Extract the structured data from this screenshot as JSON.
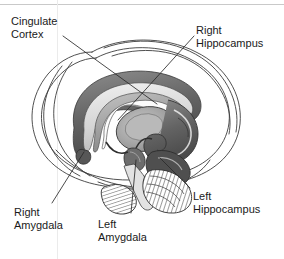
{
  "figure": {
    "background_color": "#ffffff",
    "frame_color": "#c9c9c9",
    "text_color": "#1a1a1a"
  },
  "labels": {
    "cingulate_cortex": {
      "line1": "Cingulate",
      "line2": "Cortex"
    },
    "right_hippocampus": {
      "line1": "Right",
      "line2": "Hippocampus"
    },
    "right_amygdala": {
      "line1": "Right",
      "line2": "Amygdala"
    },
    "left_amygdala": {
      "line1": "Left",
      "line2": "Amygdala"
    },
    "left_hippocampus": {
      "line1": "Left",
      "line2": "Hippocampus"
    }
  },
  "structures": [
    {
      "name": "cerebral-outline",
      "shading": "none",
      "stroke": "#3a3a3a"
    },
    {
      "name": "cingulate-gyrus-band",
      "shading": "dark-gray",
      "color": "#6e6e6e"
    },
    {
      "name": "corpus-callosum-band",
      "shading": "light-gray",
      "color": "#d5d5d5"
    },
    {
      "name": "fornix-band",
      "shading": "mid-gray",
      "color": "#9a9a9a"
    },
    {
      "name": "thalamus",
      "shading": "mid-gray",
      "color": "#a8a8a8"
    },
    {
      "name": "right-hippocampus-body",
      "shading": "dark-gray",
      "color": "#5c5c5c"
    },
    {
      "name": "left-hippocampus-body",
      "shading": "dark-gray",
      "color": "#4f4f4f"
    },
    {
      "name": "right-amygdala-nucleus",
      "shading": "dark-gray",
      "color": "#5a5a5a"
    },
    {
      "name": "left-amygdala-nucleus",
      "shading": "dark-gray",
      "color": "#6a6a6a"
    },
    {
      "name": "cerebellum",
      "shading": "hatched",
      "color": "#808080"
    },
    {
      "name": "brainstem",
      "shading": "light",
      "color": "#cccccc"
    }
  ]
}
